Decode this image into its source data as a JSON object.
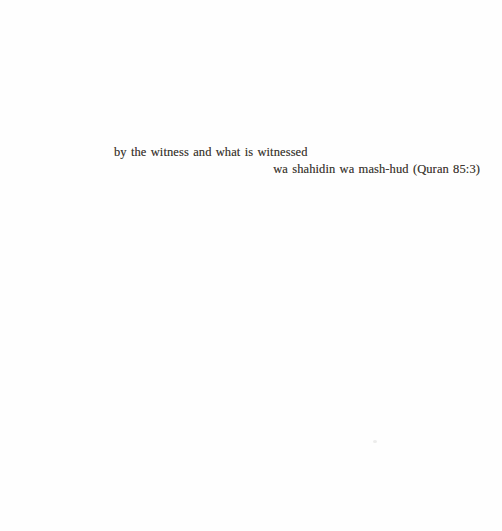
{
  "page": {
    "background": "#fefefe",
    "ink_color": "#403a34",
    "epigraph": {
      "verse": "by the witness and what is witnessed",
      "attribution": "wa shahidin wa mash-hud (Quran 85:3)"
    }
  }
}
